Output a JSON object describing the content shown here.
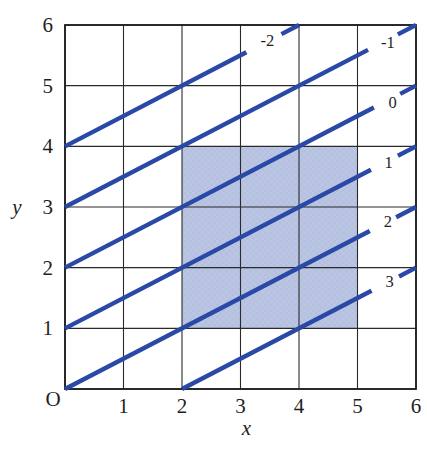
{
  "chart_data": {
    "type": "line",
    "title": "",
    "xlabel": "x",
    "ylabel": "y",
    "origin_label": "O",
    "xlim": [
      0,
      6
    ],
    "ylim": [
      0,
      6
    ],
    "x_ticks": [
      "1",
      "2",
      "3",
      "4",
      "5",
      "6"
    ],
    "y_ticks": [
      "1",
      "2",
      "3",
      "4",
      "5",
      "6"
    ],
    "grid": true,
    "grid_step": 1,
    "legend": "none",
    "shaded_region": {
      "x_range": [
        2,
        5
      ],
      "y_range": [
        1,
        4
      ]
    },
    "contour_lines": [
      {
        "label": "-2",
        "from": [
          0,
          4
        ],
        "to": [
          4,
          6
        ],
        "solid_until_x": 3.1,
        "dash_from_x": 3.7,
        "label_at": [
          3.46,
          5.74
        ]
      },
      {
        "label": "-1",
        "from": [
          0,
          3
        ],
        "to": [
          6,
          6
        ],
        "solid_until_x": 5.18,
        "dash_from_x": 5.69,
        "label_at": [
          5.52,
          5.71
        ]
      },
      {
        "label": "0",
        "from": [
          0,
          2
        ],
        "to": [
          6,
          5
        ],
        "solid_until_x": 5.28,
        "dash_from_x": 5.73,
        "label_at": [
          5.6,
          4.72
        ]
      },
      {
        "label": "1",
        "from": [
          0,
          1
        ],
        "to": [
          6,
          4
        ],
        "solid_until_x": 5.23,
        "dash_from_x": 5.69,
        "label_at": [
          5.53,
          3.74
        ]
      },
      {
        "label": "2",
        "from": [
          0,
          0
        ],
        "to": [
          6,
          3
        ],
        "solid_until_x": 5.21,
        "dash_from_x": 5.66,
        "label_at": [
          5.52,
          2.76
        ]
      },
      {
        "label": "3",
        "from": [
          2,
          0
        ],
        "to": [
          6,
          2
        ],
        "solid_until_x": 5.24,
        "dash_from_x": 5.71,
        "label_at": [
          5.55,
          1.77
        ]
      }
    ],
    "slope_of_lines": 0.5,
    "colors": {
      "contour_line": "#2a48a6",
      "region_fill": "#b8c3e2",
      "region_texture": "#a7b4d8",
      "grid_line": "#2a2a2a",
      "border": "#1f1f1f",
      "text": "#1f1f1f"
    }
  }
}
